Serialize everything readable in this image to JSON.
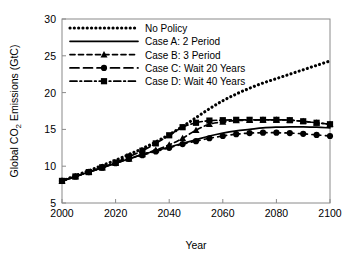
{
  "chart_data": {
    "type": "line",
    "title": "",
    "xlabel": "Year",
    "ylabel": "Global CO2 Emissions (GtC)",
    "ylabel_parts": {
      "before": "Global CO",
      "sub": "2",
      "after": " Emissions (GtC)"
    },
    "xlim": [
      2000,
      2100
    ],
    "ylim": [
      5,
      30
    ],
    "xticks": [
      2000,
      2020,
      2040,
      2060,
      2080,
      2100
    ],
    "yticks": [
      5,
      10,
      15,
      20,
      25,
      30
    ],
    "grid": false,
    "legend_position": "top-left-inside",
    "x": [
      2000,
      2005,
      2010,
      2015,
      2020,
      2025,
      2030,
      2035,
      2040,
      2045,
      2050,
      2055,
      2060,
      2065,
      2070,
      2075,
      2080,
      2085,
      2090,
      2095,
      2100
    ],
    "series": [
      {
        "name": "No Policy",
        "style": "dotted",
        "marker": "none",
        "color": "#000000",
        "values": [
          8.0,
          8.7,
          9.4,
          10.1,
          10.8,
          11.6,
          12.4,
          13.3,
          14.3,
          15.4,
          16.6,
          17.8,
          18.9,
          19.8,
          20.6,
          21.3,
          21.9,
          22.5,
          23.1,
          23.7,
          24.3
        ]
      },
      {
        "name": "Case A: 2 Period",
        "style": "solid",
        "marker": "none",
        "color": "#000000",
        "values": [
          8.0,
          8.6,
          9.2,
          9.8,
          10.4,
          11.0,
          11.6,
          12.1,
          12.6,
          13.1,
          13.6,
          14.1,
          14.5,
          14.8,
          15.0,
          15.2,
          15.3,
          15.35,
          15.35,
          15.3,
          15.2
        ]
      },
      {
        "name": "Case B: 3 Period",
        "style": "dashed",
        "marker": "triangle",
        "color": "#000000",
        "values": [
          8.0,
          8.6,
          9.2,
          9.8,
          10.4,
          11.0,
          11.6,
          12.2,
          12.9,
          13.8,
          14.9,
          15.7,
          16.0,
          16.2,
          16.25,
          16.3,
          16.3,
          16.25,
          16.1,
          15.9,
          15.7
        ]
      },
      {
        "name": "Case C: Wait 20 Years",
        "style": "longdash",
        "marker": "circle",
        "color": "#000000",
        "values": [
          8.0,
          8.6,
          9.2,
          9.8,
          10.4,
          11.0,
          11.5,
          12.0,
          12.5,
          13.0,
          13.4,
          13.8,
          14.1,
          14.35,
          14.5,
          14.55,
          14.55,
          14.5,
          14.4,
          14.25,
          14.1
        ]
      },
      {
        "name": "Case D: Wait 40 Years",
        "style": "dashdot",
        "marker": "square",
        "color": "#000000",
        "values": [
          8.0,
          8.6,
          9.2,
          9.85,
          10.5,
          11.3,
          12.1,
          13.1,
          14.2,
          15.3,
          15.9,
          16.2,
          16.25,
          16.3,
          16.3,
          16.3,
          16.3,
          16.25,
          16.1,
          15.9,
          15.7
        ]
      }
    ],
    "legend": [
      {
        "label": "No Policy",
        "style": "dotted",
        "marker": "none"
      },
      {
        "label": "Case A: 2 Period",
        "style": "solid",
        "marker": "none"
      },
      {
        "label": "Case B: 3 Period",
        "style": "dashed",
        "marker": "triangle"
      },
      {
        "label": "Case C: Wait 20 Years",
        "style": "longdash",
        "marker": "circle"
      },
      {
        "label": "Case D: Wait 40 Years",
        "style": "dashdot",
        "marker": "square"
      }
    ]
  }
}
